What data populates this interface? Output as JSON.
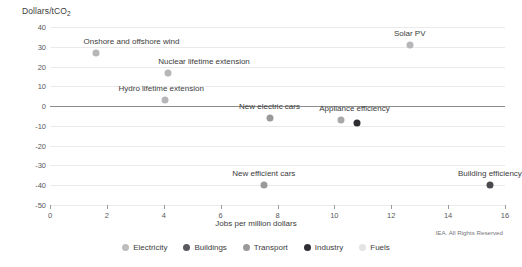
{
  "chart_data": {
    "type": "scatter",
    "title": "",
    "ylabel": "Dollars/tCO",
    "ylabel_sub": "2",
    "xlabel": "Jobs per million dollars",
    "xlim": [
      0,
      16
    ],
    "ylim": [
      -50,
      40
    ],
    "xticks": [
      0,
      2,
      4,
      6,
      8,
      10,
      12,
      14,
      16
    ],
    "yticks": [
      40,
      30,
      20,
      10,
      0,
      -10,
      -20,
      -30,
      -40,
      -50
    ],
    "grid": true,
    "legend_position": "bottom",
    "points": [
      {
        "label": "Onshore and offshore wind",
        "x": 1.6,
        "y": 27,
        "category": "Electricity",
        "color": "#b6b6b8",
        "label_dx": 36,
        "label_dy": -7
      },
      {
        "label": "Nuclear lifetime extension",
        "x": 4.15,
        "y": 16.5,
        "category": "Electricity",
        "color": "#b6b6b8",
        "label_dx": 36,
        "label_dy": -7
      },
      {
        "label": "Hydro lifetime extension",
        "x": 4.05,
        "y": 3,
        "category": "Electricity",
        "color": "#b6b6b8",
        "label_dx": -4,
        "label_dy": -7
      },
      {
        "label": "Solar PV",
        "x": 12.65,
        "y": 31,
        "category": "Electricity",
        "color": "#b6b6b8",
        "label_dx": 0,
        "label_dy": -7
      },
      {
        "label": "New electric cars",
        "x": 7.72,
        "y": -6,
        "category": "Transport",
        "color": "#9a9a9c",
        "label_dx": 0,
        "label_dy": -7
      },
      {
        "label": "Appliance efficiency",
        "x": 10.25,
        "y": -7,
        "category": "Electricity",
        "color": "#a8a8aa",
        "label_dx": 13,
        "label_dy": -7
      },
      {
        "label": "",
        "x": 10.8,
        "y": -8.5,
        "category": "Industry",
        "color": "#2f2f33",
        "label_dx": 0,
        "label_dy": -7
      },
      {
        "label": "New efficient cars",
        "x": 7.52,
        "y": -40,
        "category": "Transport",
        "color": "#9a9a9c",
        "label_dx": 0,
        "label_dy": -7
      },
      {
        "label": "Building efficiency",
        "x": 15.47,
        "y": -40,
        "category": "Buildings",
        "color": "#4a4a4e",
        "label_dx": 0,
        "label_dy": -7
      }
    ],
    "legend": [
      {
        "label": "Electricity",
        "color": "#bdbdbf"
      },
      {
        "label": "Buildings",
        "color": "#5a5a5e"
      },
      {
        "label": "Transport",
        "color": "#9a9a9c"
      },
      {
        "label": "Industry",
        "color": "#2f2f33"
      },
      {
        "label": "Fuels",
        "color": "#e4e4e6"
      }
    ]
  },
  "footer": {
    "copyright": "IEA. All Rights Reserved"
  }
}
